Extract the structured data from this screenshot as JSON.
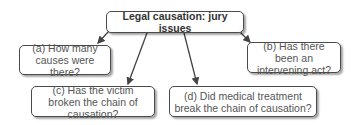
{
  "diagram": {
    "title": "Legal causation: jury issues",
    "nodes": [
      {
        "id": "a",
        "text": "(a) How many causes were there?"
      },
      {
        "id": "b",
        "text": "(b) Has there been an intervening act?"
      },
      {
        "id": "c",
        "text": "(c) Has the victim broken the chain of causation?"
      },
      {
        "id": "d",
        "text": "(d) Did medical treatment break the chain of causation?"
      }
    ],
    "edges": [
      {
        "from": "title",
        "to": "a"
      },
      {
        "from": "title",
        "to": "b"
      },
      {
        "from": "title",
        "to": "c"
      },
      {
        "from": "title",
        "to": "d"
      }
    ]
  }
}
